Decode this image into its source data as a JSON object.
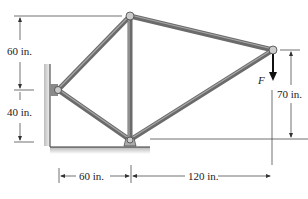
{
  "diagram": {
    "type": "truss",
    "dimensions": {
      "top_vertical": "60 in.",
      "bottom_vertical": "40 in.",
      "right_vertical": "70 in.",
      "horizontal_left": "60 in.",
      "horizontal_right": "120 in."
    },
    "load_label": "F",
    "colors": {
      "member": "#6b6b6b",
      "member_highlight": "#9a9a9a",
      "dimension_line": "#333333",
      "ground_shadow": "#bfbfbf"
    }
  }
}
